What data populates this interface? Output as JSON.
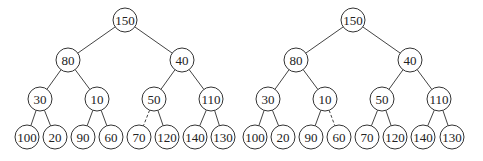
{
  "diagram": {
    "type": "binary-heap-trees",
    "colors": {
      "background": "#ffffff",
      "stroke": "#333333",
      "text": "#222222"
    },
    "node_radius": 12,
    "trees": [
      {
        "id": "left-tree",
        "nodes": [
          {
            "id": "L0",
            "label": "150",
            "x": 125,
            "y": 20
          },
          {
            "id": "L1",
            "label": "80",
            "x": 68,
            "y": 60
          },
          {
            "id": "L2",
            "label": "40",
            "x": 182,
            "y": 60
          },
          {
            "id": "L3",
            "label": "30",
            "x": 40,
            "y": 99
          },
          {
            "id": "L4",
            "label": "10",
            "x": 97,
            "y": 99
          },
          {
            "id": "L5",
            "label": "50",
            "x": 154,
            "y": 99
          },
          {
            "id": "L6",
            "label": "110",
            "x": 211,
            "y": 99
          },
          {
            "id": "L7",
            "label": "100",
            "x": 27,
            "y": 137
          },
          {
            "id": "L8",
            "label": "20",
            "x": 55,
            "y": 137
          },
          {
            "id": "L9",
            "label": "90",
            "x": 83,
            "y": 137
          },
          {
            "id": "L10",
            "label": "60",
            "x": 111,
            "y": 137
          },
          {
            "id": "L11",
            "label": "70",
            "x": 139,
            "y": 137
          },
          {
            "id": "L12",
            "label": "120",
            "x": 167,
            "y": 137
          },
          {
            "id": "L13",
            "label": "140",
            "x": 195,
            "y": 137
          },
          {
            "id": "L14",
            "label": "130",
            "x": 223,
            "y": 137
          }
        ],
        "edges": [
          {
            "from": "L0",
            "to": "L1",
            "dashed": false
          },
          {
            "from": "L0",
            "to": "L2",
            "dashed": false
          },
          {
            "from": "L1",
            "to": "L3",
            "dashed": false
          },
          {
            "from": "L1",
            "to": "L4",
            "dashed": false
          },
          {
            "from": "L2",
            "to": "L5",
            "dashed": false
          },
          {
            "from": "L2",
            "to": "L6",
            "dashed": false
          },
          {
            "from": "L3",
            "to": "L7",
            "dashed": false
          },
          {
            "from": "L3",
            "to": "L8",
            "dashed": false
          },
          {
            "from": "L4",
            "to": "L9",
            "dashed": false
          },
          {
            "from": "L4",
            "to": "L10",
            "dashed": false
          },
          {
            "from": "L5",
            "to": "L11",
            "dashed": true
          },
          {
            "from": "L5",
            "to": "L12",
            "dashed": false
          },
          {
            "from": "L6",
            "to": "L13",
            "dashed": false
          },
          {
            "from": "L6",
            "to": "L14",
            "dashed": false
          }
        ]
      },
      {
        "id": "right-tree",
        "nodes": [
          {
            "id": "R0",
            "label": "150",
            "x": 353,
            "y": 20
          },
          {
            "id": "R1",
            "label": "80",
            "x": 296,
            "y": 60
          },
          {
            "id": "R2",
            "label": "40",
            "x": 410,
            "y": 60
          },
          {
            "id": "R3",
            "label": "30",
            "x": 268,
            "y": 99
          },
          {
            "id": "R4",
            "label": "10",
            "x": 325,
            "y": 99
          },
          {
            "id": "R5",
            "label": "50",
            "x": 382,
            "y": 99
          },
          {
            "id": "R6",
            "label": "110",
            "x": 439,
            "y": 99
          },
          {
            "id": "R7",
            "label": "100",
            "x": 255,
            "y": 137
          },
          {
            "id": "R8",
            "label": "20",
            "x": 283,
            "y": 137
          },
          {
            "id": "R9",
            "label": "90",
            "x": 311,
            "y": 137
          },
          {
            "id": "R10",
            "label": "60",
            "x": 339,
            "y": 137
          },
          {
            "id": "R11",
            "label": "70",
            "x": 367,
            "y": 137
          },
          {
            "id": "R12",
            "label": "120",
            "x": 395,
            "y": 137
          },
          {
            "id": "R13",
            "label": "140",
            "x": 423,
            "y": 137
          },
          {
            "id": "R14",
            "label": "130",
            "x": 452,
            "y": 137
          }
        ],
        "edges": [
          {
            "from": "R0",
            "to": "R1",
            "dashed": false
          },
          {
            "from": "R0",
            "to": "R2",
            "dashed": false
          },
          {
            "from": "R1",
            "to": "R3",
            "dashed": false
          },
          {
            "from": "R1",
            "to": "R4",
            "dashed": false
          },
          {
            "from": "R2",
            "to": "R5",
            "dashed": false
          },
          {
            "from": "R2",
            "to": "R6",
            "dashed": false
          },
          {
            "from": "R3",
            "to": "R7",
            "dashed": false
          },
          {
            "from": "R3",
            "to": "R8",
            "dashed": false
          },
          {
            "from": "R4",
            "to": "R9",
            "dashed": false
          },
          {
            "from": "R4",
            "to": "R10",
            "dashed": true
          },
          {
            "from": "R5",
            "to": "R11",
            "dashed": false
          },
          {
            "from": "R5",
            "to": "R12",
            "dashed": false
          },
          {
            "from": "R6",
            "to": "R13",
            "dashed": false
          },
          {
            "from": "R6",
            "to": "R14",
            "dashed": false
          }
        ]
      }
    ]
  }
}
